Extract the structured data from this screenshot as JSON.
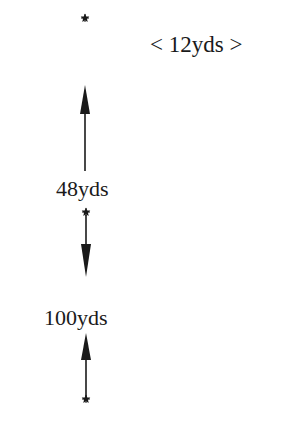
{
  "diagram": {
    "width_label": "< 12yds >",
    "segments": [
      {
        "label": "48yds",
        "direction": "up"
      },
      {
        "label": "100yds",
        "direction": "down-up"
      }
    ],
    "markers": [
      {
        "name": "top-star",
        "glyph": "star"
      },
      {
        "name": "middle-star",
        "glyph": "star"
      },
      {
        "name": "bottom-star",
        "glyph": "star"
      }
    ],
    "colors": {
      "ink": "#1a1a1a",
      "background": "#ffffff"
    }
  }
}
